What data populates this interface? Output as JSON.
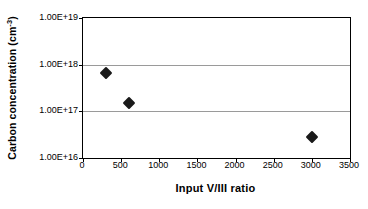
{
  "chart_data": {
    "type": "scatter",
    "title": "",
    "xlabel": "Input V/III ratio",
    "ylabel_text": "Carbon concentration (cm",
    "ylabel_sup": "-3",
    "ylabel_tail": ")",
    "ylabel_full": "Carbon concentration (cm-3)",
    "x": [
      300,
      600,
      3000
    ],
    "y": [
      6.6e+17,
      1.5e+17,
      2.8e+16
    ],
    "point_labels": [
      "6.6E+17",
      "1.5E+17",
      "2.8E+16"
    ],
    "xlim": [
      0,
      3500
    ],
    "ylim": [
      1e+16,
      1e+19
    ],
    "yscale": "log",
    "xscale": "linear",
    "grid": "horizontal",
    "legend": "none",
    "marker_style": "filled-diamond",
    "marker_color": "#1a1a1a",
    "xticks": [
      {
        "value": 0,
        "label": "0"
      },
      {
        "value": 500,
        "label": "500"
      },
      {
        "value": 1000,
        "label": "1000"
      },
      {
        "value": 1500,
        "label": "1500"
      },
      {
        "value": 2000,
        "label": "2000"
      },
      {
        "value": 2500,
        "label": "2500"
      },
      {
        "value": 3000,
        "label": "3000"
      },
      {
        "value": 3500,
        "label": "3500"
      }
    ],
    "yticks": [
      {
        "value": 1e+19,
        "label": "1.00E+19"
      },
      {
        "value": 1e+18,
        "label": "1.00E+18"
      },
      {
        "value": 1e+17,
        "label": "1.00E+17"
      },
      {
        "value": 1e+16,
        "label": "1.00E+16"
      }
    ],
    "colors": {
      "background": "#ffffff",
      "axis": "#000000",
      "gridline": "#9a9a9a",
      "marker": "#1a1a1a",
      "text": "#000000"
    }
  }
}
